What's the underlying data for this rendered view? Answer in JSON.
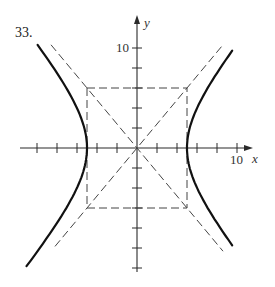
{
  "problem": {
    "number": "33."
  },
  "chart_data": {
    "type": "line",
    "title": "",
    "xlabel": "x",
    "ylabel": "y",
    "equation": "x^2/25 - y^2/36 = 1",
    "a": 5,
    "b": 6,
    "origin_px": [
      137,
      148
    ],
    "px_per_unit": 10,
    "xlim": [
      -11.7,
      11.7
    ],
    "ylim": [
      -13,
      13
    ],
    "x_ticks": [
      -10,
      -8,
      -6,
      -4,
      -2,
      2,
      4,
      6,
      8,
      10
    ],
    "y_ticks": [
      -12,
      -10,
      -8,
      -6,
      -4,
      -2,
      2,
      4,
      6,
      8,
      10
    ],
    "x_tick_labels": [
      {
        "value": 10,
        "label": "10"
      }
    ],
    "y_tick_labels": [
      {
        "value": 10,
        "label": "10"
      }
    ],
    "series": [
      {
        "name": "hyperbola right branch",
        "style": "solid",
        "x_range": [
          5,
          9.0
        ]
      },
      {
        "name": "hyperbola left branch",
        "style": "solid",
        "x_range": [
          -10.2,
          -5
        ]
      },
      {
        "name": "asymptote y = 6x/5",
        "style": "dashed"
      },
      {
        "name": "asymptote y = -6x/5",
        "style": "dashed"
      },
      {
        "name": "central rectangle",
        "style": "dashed",
        "corners": [
          [
            -5,
            6
          ],
          [
            5,
            6
          ],
          [
            5,
            -6
          ],
          [
            -5,
            -6
          ]
        ]
      }
    ],
    "vertices": [
      [
        -5,
        0
      ],
      [
        5,
        0
      ]
    ],
    "grid": false,
    "legend": null
  }
}
